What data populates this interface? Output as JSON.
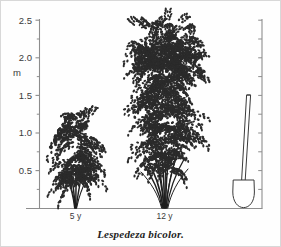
{
  "figure": {
    "caption": "Lespedeza bicolor.",
    "background_color": "#fefefe",
    "ink_color": "#2b2b2b",
    "axis_color": "#8d8d8d",
    "border_color": "#d8d8d8"
  },
  "chart_data": {
    "type": "bar",
    "title": "Lespedeza bicolor.",
    "subtitle": "",
    "xlabel": "",
    "ylabel": "m",
    "categories": [
      "5 y",
      "12 y"
    ],
    "values": [
      1.25,
      2.35
    ],
    "series": [
      {
        "name": "shrub height (m)",
        "values": [
          1.25,
          2.35
        ]
      },
      {
        "name": "crown width (m)",
        "values": [
          1.15,
          2.6
        ]
      }
    ],
    "ylim": [
      0,
      2.5
    ],
    "y_major_ticks": [
      0.5,
      1.0,
      1.5,
      2.0,
      2.5
    ],
    "y_minor_ticks": [
      0.25,
      0.75,
      1.25,
      1.75,
      2.25
    ],
    "y_tick_labels": [
      "0.5",
      "1.0",
      "1.5",
      "2.0",
      "2.5"
    ],
    "grid": false,
    "legend": "none",
    "annotations": [
      {
        "label": "5 y",
        "meaning": "five-year-old shrub",
        "height_m": 1.25
      },
      {
        "label": "12 y",
        "meaning": "twelve-year-old shrub",
        "height_m": 2.35
      },
      {
        "label": "spade",
        "meaning": "scale reference spade",
        "height_m": 1.5
      }
    ],
    "right_axis": {
      "shown": true,
      "ticks": [
        0.25,
        0.5,
        0.75,
        1.0,
        1.25,
        1.5,
        1.75,
        2.0,
        2.25,
        2.5
      ]
    }
  },
  "axis": {
    "unit_label": "m",
    "labels": [
      "2.5",
      "2.0",
      "1.5",
      "1.0",
      "0.5"
    ],
    "values": [
      2.5,
      2.0,
      1.5,
      1.0,
      0.5
    ]
  },
  "specimens": [
    {
      "id": "shrub-5y",
      "label": "5 y"
    },
    {
      "id": "shrub-12y",
      "label": "12 y"
    }
  ],
  "scale_object": {
    "name": "spade",
    "height_m": 1.5
  }
}
